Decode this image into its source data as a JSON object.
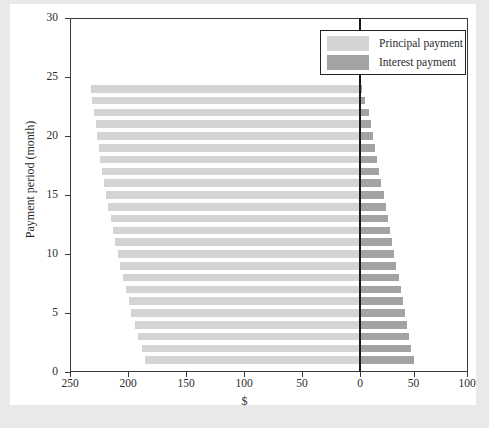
{
  "chart": {
    "type": "bar",
    "title": "",
    "xlabel": "$",
    "ylabel": "Payment period (month)",
    "legend": {
      "position": "top-right",
      "entries": [
        {
          "label": "Principal payment",
          "color": "#d4d4d4"
        },
        {
          "label": "Interest payment",
          "color": "#a3a3a3"
        }
      ]
    }
  },
  "axes": {
    "x": {
      "ticks": [
        250,
        200,
        150,
        100,
        50,
        0,
        50,
        100
      ],
      "tick_labels": [
        "250",
        "200",
        "150",
        "100",
        "50",
        "0",
        "50",
        "100"
      ],
      "left_range": [
        250,
        0
      ],
      "right_range": [
        0,
        100
      ],
      "label": "$"
    },
    "y": {
      "ticks": [
        0,
        5,
        10,
        15,
        20,
        25,
        30
      ],
      "tick_labels": [
        "0",
        "5",
        "10",
        "15",
        "20",
        "25",
        "30"
      ],
      "range": [
        0,
        30
      ],
      "label": "Payment period (month)"
    }
  },
  "chart_data": {
    "type": "bar",
    "orientation": "horizontal",
    "title": "",
    "xlabel": "$",
    "ylabel": "Payment period (month)",
    "xlim": [
      250,
      100
    ],
    "ylim": [
      0,
      30
    ],
    "grid": false,
    "legend_position": "top-right",
    "note": "Diverging horizontal bars. Principal payment extends left of zero on a reversed axis (0 at x=350px, 250 at far left); Interest payment extends right of zero.",
    "categories": [
      1,
      2,
      3,
      4,
      5,
      6,
      7,
      8,
      9,
      10,
      11,
      12,
      13,
      14,
      15,
      16,
      17,
      18,
      19,
      20,
      21,
      22,
      23,
      24
    ],
    "series": [
      {
        "name": "Principal payment",
        "color": "#d4d4d4",
        "direction": "left",
        "values": [
          185,
          188,
          191,
          194,
          197,
          199,
          202,
          204,
          207,
          209,
          211,
          213,
          215,
          217,
          219,
          221,
          222,
          224,
          225,
          227,
          228,
          229,
          231,
          232
        ]
      },
      {
        "name": "Interest payment",
        "color": "#a3a3a3",
        "direction": "right",
        "values": [
          50,
          48,
          46,
          44,
          42,
          40,
          38,
          36,
          34,
          32,
          30,
          28,
          26,
          24,
          22,
          20,
          18,
          16,
          14,
          12,
          10,
          8,
          5,
          2
        ]
      }
    ]
  }
}
